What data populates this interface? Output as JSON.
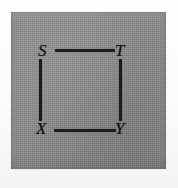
{
  "figure": {
    "caption": "",
    "panel_background_color": "#8a8a8a",
    "ink_color": "#1c1c1c",
    "page_background_color": "#fdfdfd"
  },
  "graph": {
    "type": "undirected-graph",
    "shape": "4-cycle square",
    "vertices": [
      {
        "id": "S",
        "label": "S",
        "position": "top-left"
      },
      {
        "id": "T",
        "label": "T",
        "position": "top-right"
      },
      {
        "id": "X",
        "label": "X",
        "position": "bottom-left"
      },
      {
        "id": "Y",
        "label": "Y",
        "position": "bottom-right"
      }
    ],
    "edges": [
      {
        "id": "ST",
        "from": "S",
        "to": "T",
        "orientation": "horizontal"
      },
      {
        "id": "SX",
        "from": "S",
        "to": "X",
        "orientation": "vertical"
      },
      {
        "id": "TY",
        "from": "T",
        "to": "Y",
        "orientation": "vertical"
      },
      {
        "id": "XY",
        "from": "X",
        "to": "Y",
        "orientation": "horizontal"
      }
    ]
  }
}
